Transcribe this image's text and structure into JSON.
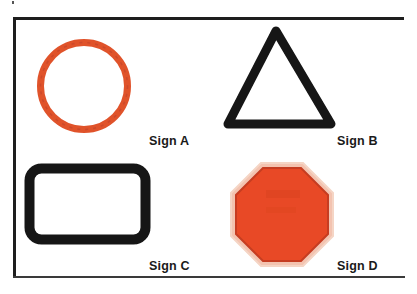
{
  "figure": {
    "signs": [
      {
        "id": "A",
        "label": "Sign A",
        "shape": "circle",
        "style": "outline",
        "color": "#e0532c"
      },
      {
        "id": "B",
        "label": "Sign B",
        "shape": "triangle",
        "style": "outline",
        "color": "#111111"
      },
      {
        "id": "C",
        "label": "Sign C",
        "shape": "rounded-rectangle",
        "style": "outline",
        "color": "#111111"
      },
      {
        "id": "D",
        "label": "Sign D",
        "shape": "octagon",
        "style": "filled",
        "color": "#e84a25"
      }
    ]
  }
}
